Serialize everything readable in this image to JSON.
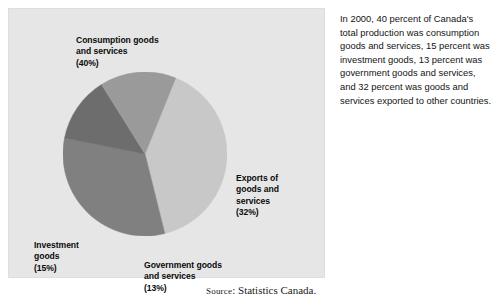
{
  "figure": {
    "panel_background": "#e6e6e6",
    "source": {
      "prefix": "Source",
      "text": ": Statistics Canada."
    }
  },
  "caption": {
    "text": "In 2000, 40 percent of Canada's total production was consumption goods and services, 15 percent was investment goods, 13 percent was government goods and services, and 32 percent was goods and services exported to other countries."
  },
  "labels": {
    "consumption": {
      "name": "Consumption goods\nand services",
      "pct": "(40%)"
    },
    "exports": {
      "name": "Exports of\ngoods and\nservices",
      "pct": "(32%)"
    },
    "investment": {
      "name": "Investment\ngoods",
      "pct": "(15%)"
    },
    "government": {
      "name": "Government goods\nand services",
      "pct": "(13%)"
    }
  },
  "chart_data": {
    "type": "pie",
    "title": "",
    "subtitle": "",
    "xlabel": "",
    "ylabel": "",
    "legend_position": "callout-labels",
    "grid": false,
    "units": "percent",
    "start_angle_deg": 22,
    "direction": "clockwise",
    "categories": [
      "Consumption goods and services",
      "Exports of goods and services",
      "Government goods and services",
      "Investment goods"
    ],
    "values": [
      40,
      32,
      13,
      15
    ],
    "colors": [
      "#c8c8c8",
      "#808080",
      "#6d6d6d",
      "#9a9a9a"
    ],
    "slices": [
      {
        "label": "Consumption goods and services",
        "value": 40,
        "display": "(40%)",
        "color": "#c8c8c8"
      },
      {
        "label": "Exports of goods and services",
        "value": 32,
        "display": "(32%)",
        "color": "#808080"
      },
      {
        "label": "Government goods and services",
        "value": 13,
        "display": "(13%)",
        "color": "#6d6d6d"
      },
      {
        "label": "Investment goods",
        "value": 15,
        "display": "(15%)",
        "color": "#9a9a9a"
      }
    ],
    "source": "Statistics Canada.",
    "annotations": [
      "In 2000, 40 percent of Canada's total production was consumption goods and services, 15 percent was investment goods, 13 percent was government goods and services, and 32 percent was goods and services exported to other countries."
    ]
  }
}
